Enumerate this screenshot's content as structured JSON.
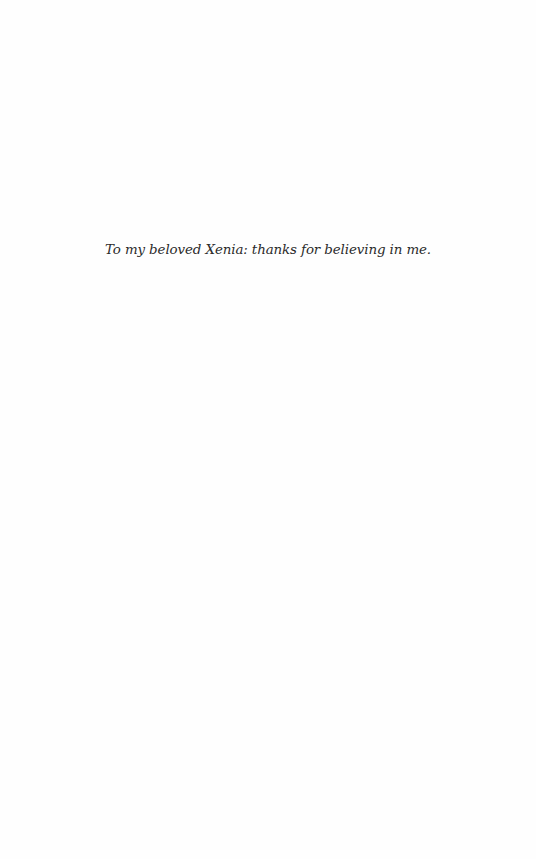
{
  "page": {
    "background": "#fefefe",
    "text_color": "#2b2b2b"
  },
  "dedication": {
    "text": "To my beloved Xenia: thanks for believing in me."
  }
}
